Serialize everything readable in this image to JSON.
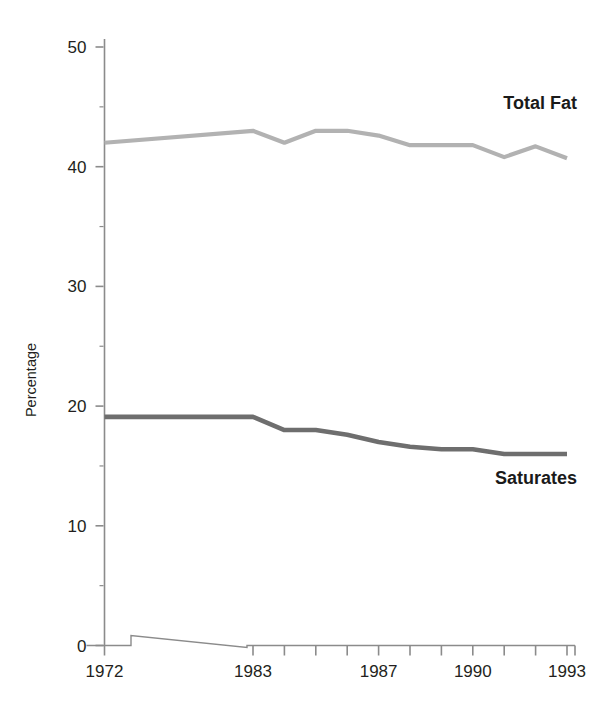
{
  "chart_data": {
    "type": "line",
    "title": "",
    "subtitle": "",
    "xlabel": "",
    "ylabel": "Percentage",
    "ylim": [
      0,
      50
    ],
    "y_ticks": [
      0,
      10,
      20,
      30,
      40,
      50
    ],
    "y_tick_labels": [
      "0",
      "10",
      "20",
      "30",
      "40",
      "50"
    ],
    "y_minor_ticks": [
      5,
      15,
      25,
      35,
      45
    ],
    "grid": false,
    "legend_position": "inline-right",
    "axis_break": {
      "present": true,
      "between": [
        "1972",
        "1983"
      ],
      "style": "diagonal-slant"
    },
    "x": [
      1972,
      1983,
      1984,
      1985,
      1986,
      1987,
      1988,
      1989,
      1990,
      1991,
      1992,
      1993
    ],
    "x_tick_labels": [
      "1972",
      "1983",
      "",
      "",
      "",
      "1987",
      "",
      "",
      "1990",
      "",
      "",
      "1993"
    ],
    "x_labeled_ticks": [
      "1972",
      "1983",
      "1987",
      "1990",
      "1993"
    ],
    "series": [
      {
        "name": "Total Fat",
        "color": "#b2b2b2",
        "values": [
          42.0,
          43.0,
          42.0,
          43.0,
          43.0,
          42.6,
          41.8,
          41.8,
          41.8,
          40.8,
          41.7,
          40.7
        ]
      },
      {
        "name": "Saturates",
        "color": "#6e6e6e",
        "values": [
          19.1,
          19.1,
          18.0,
          18.0,
          17.6,
          17.0,
          16.6,
          16.4,
          16.4,
          16.0,
          16.0,
          16.0
        ]
      }
    ],
    "annotations": [
      {
        "text": "Total Fat",
        "series": "Total Fat"
      },
      {
        "text": "Saturates",
        "series": "Saturates"
      }
    ]
  },
  "axis_colors": {
    "axis": "#8b8b8b",
    "text": "#231f20"
  }
}
